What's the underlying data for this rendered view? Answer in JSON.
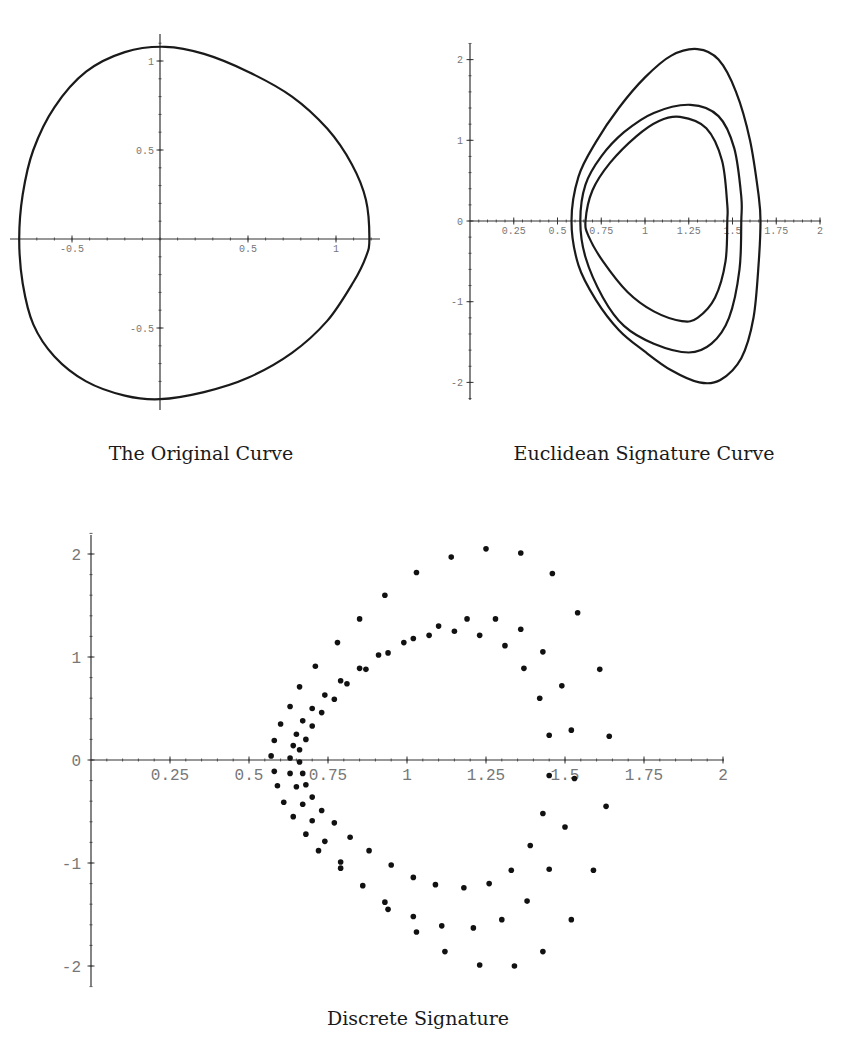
{
  "captions": {
    "original": "The Original Curve",
    "euclidean": "Euclidean Signature Curve",
    "discrete": "Discrete Signature"
  },
  "colors": {
    "curve": "#1a1a1a",
    "axis": "#333333",
    "tick_label": "#777777",
    "dot": "#111111"
  },
  "chart_data": [
    {
      "id": "original",
      "type": "line",
      "title": "The Original Curve",
      "xlabel": "",
      "ylabel": "",
      "xlim": [
        -0.8,
        1.2
      ],
      "ylim": [
        -0.9,
        1.1
      ],
      "x_ticks": [
        -0.5,
        0.5,
        1
      ],
      "y_ticks": [
        1,
        0.5,
        -0.5
      ],
      "x_tick_labels": [
        "-0.5",
        "0.5",
        "1"
      ],
      "y_tick_labels": [
        "1",
        "0.5",
        "-0.5"
      ],
      "grid": false,
      "series": [
        {
          "name": "closed curve",
          "points": [
            [
              1.19,
              0.0
            ],
            [
              1.17,
              0.22
            ],
            [
              1.09,
              0.42
            ],
            [
              0.95,
              0.62
            ],
            [
              0.75,
              0.8
            ],
            [
              0.5,
              0.94
            ],
            [
              0.25,
              1.04
            ],
            [
              0.03,
              1.08
            ],
            [
              -0.2,
              1.05
            ],
            [
              -0.42,
              0.94
            ],
            [
              -0.6,
              0.74
            ],
            [
              -0.72,
              0.5
            ],
            [
              -0.78,
              0.25
            ],
            [
              -0.8,
              0.0
            ],
            [
              -0.78,
              -0.25
            ],
            [
              -0.72,
              -0.48
            ],
            [
              -0.6,
              -0.66
            ],
            [
              -0.42,
              -0.8
            ],
            [
              -0.2,
              -0.88
            ],
            [
              0.0,
              -0.9
            ],
            [
              0.25,
              -0.86
            ],
            [
              0.5,
              -0.78
            ],
            [
              0.75,
              -0.64
            ],
            [
              0.95,
              -0.46
            ],
            [
              1.1,
              -0.24
            ],
            [
              1.17,
              -0.1
            ],
            [
              1.19,
              0.0
            ]
          ]
        }
      ]
    },
    {
      "id": "euclidean",
      "type": "line",
      "title": "Euclidean Signature Curve",
      "xlabel": "",
      "ylabel": "",
      "xlim": [
        0,
        2
      ],
      "ylim": [
        -2.2,
        2.2
      ],
      "x_ticks": [
        0.25,
        0.5,
        0.75,
        1,
        1.25,
        1.5,
        1.75,
        2
      ],
      "y_ticks": [
        2,
        1,
        0,
        -1,
        -2
      ],
      "x_tick_labels": [
        "0.25",
        "0.5",
        "0.75",
        "1",
        "1.25",
        "1.5",
        "1.75",
        "2"
      ],
      "y_tick_labels": [
        "2",
        "1",
        "0",
        "-1",
        "-2"
      ],
      "grid": false,
      "series": [
        {
          "name": "outer",
          "points": [
            [
              0.58,
              0.0
            ],
            [
              0.62,
              0.55
            ],
            [
              0.72,
              0.98
            ],
            [
              0.85,
              1.4
            ],
            [
              1.0,
              1.78
            ],
            [
              1.15,
              2.05
            ],
            [
              1.3,
              2.13
            ],
            [
              1.42,
              2.0
            ],
            [
              1.52,
              1.6
            ],
            [
              1.6,
              1.0
            ],
            [
              1.65,
              0.3
            ],
            [
              1.66,
              0.0
            ],
            [
              1.65,
              -0.5
            ],
            [
              1.62,
              -1.2
            ],
            [
              1.55,
              -1.7
            ],
            [
              1.43,
              -1.97
            ],
            [
              1.31,
              -2.0
            ],
            [
              1.15,
              -1.85
            ],
            [
              1.0,
              -1.62
            ],
            [
              0.85,
              -1.35
            ],
            [
              0.72,
              -0.98
            ],
            [
              0.62,
              -0.55
            ],
            [
              0.58,
              0.0
            ]
          ]
        },
        {
          "name": "middle",
          "points": [
            [
              0.63,
              0.0
            ],
            [
              0.66,
              0.45
            ],
            [
              0.75,
              0.8
            ],
            [
              0.88,
              1.1
            ],
            [
              1.05,
              1.34
            ],
            [
              1.26,
              1.44
            ],
            [
              1.42,
              1.3
            ],
            [
              1.51,
              0.9
            ],
            [
              1.55,
              0.3
            ],
            [
              1.55,
              0.0
            ],
            [
              1.54,
              -0.6
            ],
            [
              1.48,
              -1.2
            ],
            [
              1.38,
              -1.52
            ],
            [
              1.25,
              -1.63
            ],
            [
              1.05,
              -1.52
            ],
            [
              0.88,
              -1.3
            ],
            [
              0.76,
              -0.95
            ],
            [
              0.66,
              -0.45
            ],
            [
              0.63,
              0.0
            ]
          ]
        },
        {
          "name": "inner",
          "points": [
            [
              0.66,
              0.0
            ],
            [
              0.7,
              0.38
            ],
            [
              0.8,
              0.72
            ],
            [
              0.95,
              1.05
            ],
            [
              1.08,
              1.24
            ],
            [
              1.2,
              1.29
            ],
            [
              1.35,
              1.15
            ],
            [
              1.44,
              0.75
            ],
            [
              1.47,
              0.2
            ],
            [
              1.47,
              0.0
            ],
            [
              1.46,
              -0.5
            ],
            [
              1.4,
              -0.95
            ],
            [
              1.3,
              -1.2
            ],
            [
              1.21,
              -1.24
            ],
            [
              1.05,
              -1.12
            ],
            [
              0.9,
              -0.88
            ],
            [
              0.76,
              -0.5
            ],
            [
              0.68,
              -0.2
            ],
            [
              0.66,
              0.0
            ]
          ]
        }
      ]
    },
    {
      "id": "discrete",
      "type": "scatter",
      "title": "Discrete Signature",
      "xlabel": "",
      "ylabel": "",
      "xlim": [
        0,
        2
      ],
      "ylim": [
        -2.2,
        2.2
      ],
      "x_ticks": [
        0.25,
        0.5,
        0.75,
        1,
        1.25,
        1.5,
        1.75,
        2
      ],
      "y_ticks": [
        2,
        1,
        0,
        -1,
        -2
      ],
      "x_tick_labels": [
        "0.25",
        "0.5",
        "0.75",
        "1",
        "1.25",
        "1.5",
        "1.75",
        "2"
      ],
      "y_tick_labels": [
        "2",
        "1",
        "0",
        "-1",
        "-2"
      ],
      "grid": false,
      "points": [
        [
          0.57,
          0.04
        ],
        [
          0.58,
          0.19
        ],
        [
          0.6,
          0.35
        ],
        [
          0.63,
          0.52
        ],
        [
          0.66,
          0.71
        ],
        [
          0.71,
          0.91
        ],
        [
          0.78,
          1.14
        ],
        [
          0.85,
          1.37
        ],
        [
          0.93,
          1.6
        ],
        [
          1.03,
          1.82
        ],
        [
          1.14,
          1.97
        ],
        [
          1.25,
          2.05
        ],
        [
          1.36,
          2.01
        ],
        [
          1.46,
          1.81
        ],
        [
          1.54,
          1.43
        ],
        [
          1.61,
          0.88
        ],
        [
          1.64,
          0.23
        ],
        [
          0.63,
          0.02
        ],
        [
          0.64,
          0.14
        ],
        [
          0.66,
          0.1
        ],
        [
          0.65,
          0.25
        ],
        [
          0.68,
          0.2
        ],
        [
          0.67,
          0.38
        ],
        [
          0.7,
          0.33
        ],
        [
          0.7,
          0.5
        ],
        [
          0.73,
          0.46
        ],
        [
          0.74,
          0.63
        ],
        [
          0.77,
          0.59
        ],
        [
          0.79,
          0.77
        ],
        [
          0.81,
          0.74
        ],
        [
          0.85,
          0.89
        ],
        [
          0.87,
          0.88
        ],
        [
          0.91,
          1.02
        ],
        [
          0.94,
          1.04
        ],
        [
          0.99,
          1.14
        ],
        [
          1.02,
          1.18
        ],
        [
          1.07,
          1.21
        ],
        [
          1.1,
          1.3
        ],
        [
          1.15,
          1.25
        ],
        [
          1.19,
          1.37
        ],
        [
          1.23,
          1.21
        ],
        [
          1.28,
          1.37
        ],
        [
          1.31,
          1.11
        ],
        [
          1.36,
          1.27
        ],
        [
          1.37,
          0.89
        ],
        [
          1.43,
          1.05
        ],
        [
          1.42,
          0.6
        ],
        [
          1.49,
          0.72
        ],
        [
          1.45,
          0.24
        ],
        [
          1.52,
          0.29
        ],
        [
          0.58,
          -0.11
        ],
        [
          0.63,
          -0.13
        ],
        [
          0.67,
          -0.13
        ],
        [
          0.66,
          -0.02
        ],
        [
          0.59,
          -0.25
        ],
        [
          0.65,
          -0.26
        ],
        [
          0.68,
          -0.24
        ],
        [
          0.61,
          -0.41
        ],
        [
          0.67,
          -0.43
        ],
        [
          0.7,
          -0.36
        ],
        [
          0.64,
          -0.55
        ],
        [
          0.7,
          -0.59
        ],
        [
          0.73,
          -0.49
        ],
        [
          0.68,
          -0.72
        ],
        [
          0.74,
          -0.79
        ],
        [
          0.77,
          -0.61
        ],
        [
          0.72,
          -0.88
        ],
        [
          0.79,
          -0.99
        ],
        [
          0.82,
          -0.75
        ],
        [
          0.79,
          -1.05
        ],
        [
          0.88,
          -0.88
        ],
        [
          0.86,
          -1.22
        ],
        [
          0.95,
          -1.02
        ],
        [
          0.93,
          -1.38
        ],
        [
          0.94,
          -1.45
        ],
        [
          1.02,
          -1.14
        ],
        [
          1.02,
          -1.52
        ],
        [
          1.03,
          -1.67
        ],
        [
          1.09,
          -1.21
        ],
        [
          1.11,
          -1.61
        ],
        [
          1.12,
          -1.86
        ],
        [
          1.18,
          -1.24
        ],
        [
          1.21,
          -1.63
        ],
        [
          1.23,
          -1.99
        ],
        [
          1.26,
          -1.2
        ],
        [
          1.3,
          -1.55
        ],
        [
          1.34,
          -2.0
        ],
        [
          1.33,
          -1.07
        ],
        [
          1.38,
          -1.37
        ],
        [
          1.43,
          -1.86
        ],
        [
          1.39,
          -0.83
        ],
        [
          1.45,
          -1.06
        ],
        [
          1.52,
          -1.55
        ],
        [
          1.43,
          -0.52
        ],
        [
          1.5,
          -0.65
        ],
        [
          1.59,
          -1.07
        ],
        [
          1.45,
          -0.15
        ],
        [
          1.53,
          -0.18
        ],
        [
          1.63,
          -0.45
        ]
      ]
    }
  ]
}
